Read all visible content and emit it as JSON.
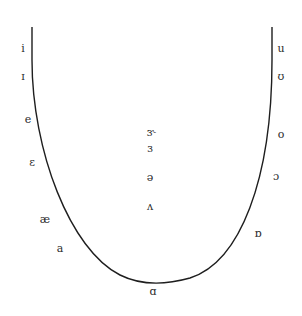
{
  "diagram": {
    "title": "",
    "curve": {
      "stroke": "#1e1e1e",
      "path": "M 32 27 L 32 60 C 32 150, 70 250, 120 275 C 140 285, 165 285, 190 278 C 240 262, 272 180, 272 60 L 272 27"
    },
    "front_vowels": [
      {
        "symbol": "i",
        "x": 23,
        "y": 48
      },
      {
        "symbol": "ɪ",
        "x": 23,
        "y": 76
      },
      {
        "symbol": "e",
        "x": 28,
        "y": 119
      },
      {
        "symbol": "ɛ",
        "x": 32,
        "y": 162
      },
      {
        "symbol": "æ",
        "x": 45,
        "y": 219
      },
      {
        "symbol": "a",
        "x": 60,
        "y": 248
      }
    ],
    "back_vowels": [
      {
        "symbol": "u",
        "x": 281,
        "y": 48
      },
      {
        "symbol": "ʊ",
        "x": 281,
        "y": 76
      },
      {
        "symbol": "o",
        "x": 281,
        "y": 134
      },
      {
        "symbol": "ɔ",
        "x": 276,
        "y": 176
      },
      {
        "symbol": "ɒ",
        "x": 258,
        "y": 233
      }
    ],
    "low_vowels": [
      {
        "symbol": "ɑ",
        "x": 153,
        "y": 291
      }
    ],
    "central_vowels": [
      {
        "symbol": "ɝ",
        "x": 151,
        "y": 132
      },
      {
        "symbol": "ɜ",
        "x": 150,
        "y": 148
      },
      {
        "symbol": "ə",
        "x": 150,
        "y": 177
      },
      {
        "symbol": "ʌ",
        "x": 150,
        "y": 206
      }
    ]
  }
}
